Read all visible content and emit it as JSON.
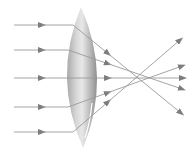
{
  "diagram": {
    "title": "",
    "colors": {
      "background": "#ffffff",
      "ray": "#9a9a9a",
      "arrow": "#7d7d7d",
      "lens_light": "#e4e4e4",
      "lens_mid": "#b8b8b8",
      "lens_dark": "#8e8e8e"
    },
    "lens": {
      "type": "biconvex",
      "cx": 82,
      "top": 7,
      "bottom": 148,
      "half_width": 15
    },
    "rays": [
      {
        "y_in": 25,
        "x_lens": 73,
        "out_end": [
          181,
          113
        ]
      },
      {
        "y_in": 50,
        "x_lens": 68,
        "out_end": [
          182,
          89
        ]
      },
      {
        "y_in": 78,
        "x_lens": 67,
        "out_end": [
          183,
          78
        ]
      },
      {
        "y_in": 107,
        "x_lens": 68,
        "out_end": [
          182,
          66
        ]
      },
      {
        "y_in": 132,
        "x_lens": 73,
        "out_end": [
          180,
          40
        ]
      }
    ]
  }
}
